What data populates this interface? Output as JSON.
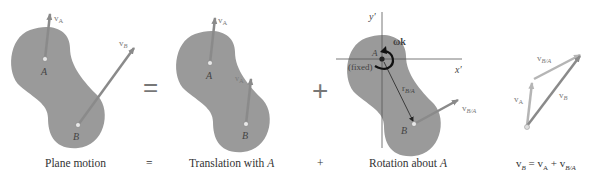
{
  "captions": {
    "plane_motion": "Plane motion",
    "equals": "=",
    "translation": "Translation with ",
    "translation_point": "A",
    "plus": "+",
    "rotation": "Rotation about ",
    "rotation_point": "A",
    "equation": {
      "vB": "v",
      "vB_sub": "B",
      "eq": " = ",
      "vA": "v",
      "vA_sub": "A",
      "plus": " + ",
      "vBA": "v",
      "vBA_sub": "B/A"
    }
  },
  "operators": {
    "equals": "=",
    "plus": "+"
  },
  "labels": {
    "point_A": "A",
    "point_B": "B",
    "v": "v",
    "sub_A": "A",
    "sub_B": "B",
    "sub_BA": "B/A",
    "r": "r",
    "fixed": "(fixed)",
    "omega_k": "ωk",
    "y_axis": "y′",
    "x_axis": "x′"
  },
  "colors": {
    "body_fill": "#9a9a9a",
    "arrow": "#8a8a8a",
    "arrow_light": "#b5b5b5",
    "text": "#333333",
    "axis": "#555555",
    "omega_arrow": "#111111"
  }
}
